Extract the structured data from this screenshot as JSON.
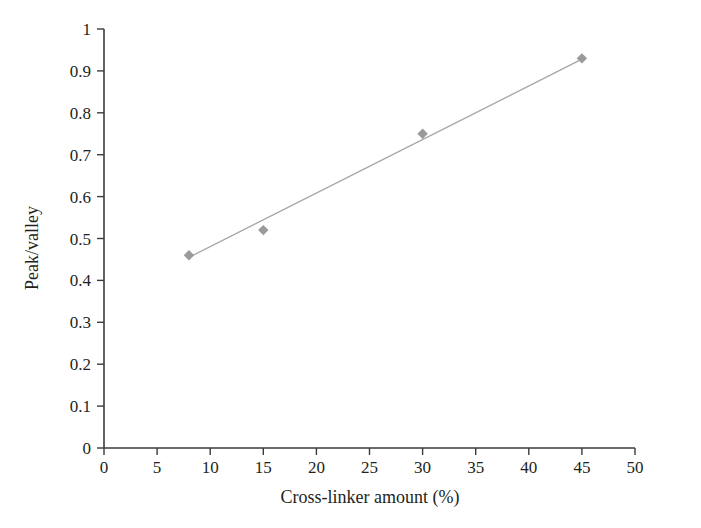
{
  "chart_data": {
    "type": "scatter",
    "title": "",
    "xlabel": "Cross-linker amount (%)",
    "ylabel": "Peak/valley",
    "xlim": [
      0,
      50
    ],
    "ylim": [
      0,
      1
    ],
    "grid": false,
    "legend": "none",
    "x": [
      8,
      15,
      30,
      45
    ],
    "values": [
      0.46,
      0.52,
      0.75,
      0.93
    ],
    "series": [
      {
        "name": "Peak/valley",
        "x": [
          8,
          15,
          30,
          45
        ],
        "values": [
          0.46,
          0.52,
          0.75,
          0.93
        ],
        "marker": "diamond",
        "marker_color": "#9a9a9a",
        "trendline": {
          "type": "linear",
          "color": "#a6a6a6",
          "x_start": 8,
          "y_start": 0.455,
          "x_end": 45,
          "y_end": 0.928
        }
      }
    ],
    "xticks": [
      0,
      5,
      10,
      15,
      20,
      25,
      30,
      35,
      40,
      45,
      50
    ],
    "xtick_labels": [
      "0",
      "5",
      "10",
      "15",
      "20",
      "25",
      "30",
      "35",
      "40",
      "45",
      "50"
    ],
    "yticks": [
      0,
      0.1,
      0.2,
      0.3,
      0.4,
      0.5,
      0.6,
      0.7,
      0.8,
      0.9,
      1
    ],
    "ytick_labels": [
      "0",
      "0.1",
      "0.2",
      "0.3",
      "0.4",
      "0.5",
      "0.6",
      "0.7",
      "0.8",
      "0.9",
      "1"
    ]
  },
  "axis_colors": {
    "axis_line": "#3b3b3b",
    "marker": "#9a9a9a",
    "trendline": "#a6a6a6",
    "text": "#231f20",
    "background": "#ffffff"
  }
}
